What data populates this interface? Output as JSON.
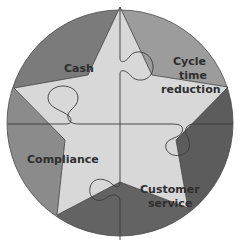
{
  "diagram": {
    "type": "star-puzzle-in-circle",
    "labels": {
      "cash": "Cash",
      "cycle_line1": "Cycle",
      "cycle_line2": "time",
      "cycle_line3": "reduction",
      "compliance": "Compliance",
      "customer_line1": "Customer",
      "customer_line2": "service"
    },
    "colors": {
      "sector_top_left": "#7b7b7b",
      "sector_top_right": "#9c9c9c",
      "sector_right": "#5c5c5c",
      "sector_bottom": "#636363",
      "sector_left": "#8b8b8b",
      "star_fill": "#d8d8d8",
      "outline": "#3a3a3a",
      "text": "#2e2e2e"
    }
  }
}
